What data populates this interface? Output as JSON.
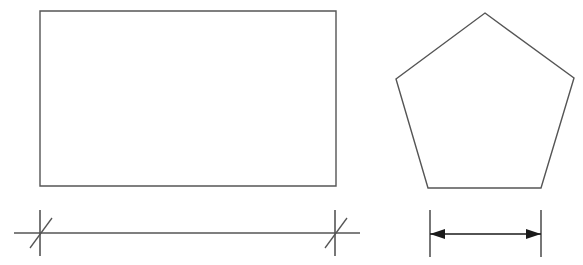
{
  "figure": {
    "title": "Geometric shapes with linear dimension annotations",
    "background_color": "#ffffff",
    "width": 583,
    "height": 265,
    "stroke_color": "#555555",
    "arrow_color": "#1a1a1a"
  },
  "shapes": [
    {
      "name": "rectangle",
      "type": "rectangle",
      "label": "Rectangle",
      "x": 40,
      "y": 11,
      "width": 296,
      "height": 175,
      "stroke_color": "#555555",
      "stroke_width": 1.4,
      "fill": "none",
      "points": "40,11 336,11 336,186 40,186"
    },
    {
      "name": "pentagon",
      "type": "polygon",
      "label": "Pentagon",
      "sides": 5,
      "stroke_color": "#555555",
      "stroke_width": 1.4,
      "fill": "none",
      "points": "485,13 574,78 541,188 428,188 396,79",
      "vertices": [
        {
          "name": "apex",
          "x": 485,
          "y": 13
        },
        {
          "name": "upper-right",
          "x": 574,
          "y": 78
        },
        {
          "name": "lower-right",
          "x": 541,
          "y": 188
        },
        {
          "name": "lower-left",
          "x": 428,
          "y": 188
        },
        {
          "name": "upper-left",
          "x": 396,
          "y": 79
        }
      ]
    }
  ],
  "dimensions": [
    {
      "name": "rectangle-width-dimension",
      "label": "",
      "terminator_style": "architectural-tick",
      "measures": "rectangle-width",
      "line": {
        "y": 233,
        "x1": 14,
        "x2": 360
      },
      "ticks": [
        {
          "name": "left-tick",
          "x": 40,
          "vertical": {
            "y1": 210,
            "y2": 256
          },
          "slash": {
            "x1": 30,
            "y1": 248,
            "x2": 52,
            "y2": 218
          }
        },
        {
          "name": "right-tick",
          "x": 335,
          "vertical": {
            "y1": 210,
            "y2": 256
          },
          "slash": {
            "x1": 325,
            "y1": 248,
            "x2": 347,
            "y2": 218
          }
        }
      ]
    },
    {
      "name": "pentagon-width-dimension",
      "label": "",
      "terminator_style": "filled-arrowhead",
      "measures": "pentagon-base-width",
      "arrow_line": {
        "y": 234,
        "x1": 430,
        "x2": 541
      },
      "extension_lines": [
        {
          "name": "left-extension-line",
          "x": 430,
          "y1": 210,
          "y2": 257
        },
        {
          "name": "right-extension-line",
          "x": 541,
          "y1": 210,
          "y2": 257
        }
      ],
      "arrowheads": [
        {
          "name": "left-arrowhead",
          "direction": "left",
          "tip_x": 430,
          "tip_y": 234,
          "length": 15,
          "half_width": 5
        },
        {
          "name": "right-arrowhead",
          "direction": "right",
          "tip_x": 541,
          "tip_y": 234,
          "length": 15,
          "half_width": 5
        }
      ]
    }
  ]
}
